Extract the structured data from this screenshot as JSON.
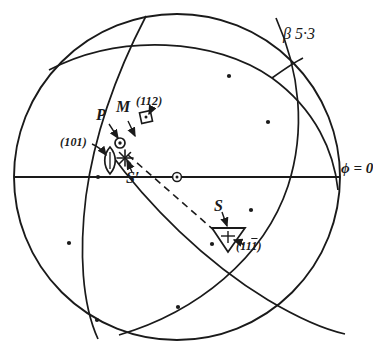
{
  "figure": {
    "type": "stereographic-projection",
    "primitive_circle": {
      "cx": 177,
      "cy": 177,
      "r": 163
    },
    "center_marker": "circled-dot"
  },
  "labels": {
    "beta": "β 5·3",
    "phi": "ϕ = 0",
    "pole_p": "P",
    "pole_m": "M",
    "pole_s_prime": "S′",
    "pole_s": "S",
    "face_101": "(101)",
    "face_112": "(112)",
    "face_11bar1": "(11̅1)"
  },
  "face_indices": {
    "f101": {
      "h": "1",
      "k": "0",
      "l": "1",
      "bar": "none"
    },
    "f112": {
      "h": "1",
      "k": "1",
      "l": "2",
      "bar": "none"
    },
    "f111bar": {
      "h": "1",
      "k": "1",
      "l": "1",
      "bar": "l"
    }
  },
  "markers": [
    {
      "name": "pole-p-circled-dot",
      "symbol": "circled-dot",
      "x": 120,
      "y": 143
    },
    {
      "name": "pole-s-prime-star",
      "symbol": "asterisk",
      "x": 125,
      "y": 158
    },
    {
      "name": "face-101-lens",
      "symbol": "lens",
      "x": 110,
      "y": 160
    },
    {
      "name": "face-112-square",
      "symbol": "square-dot",
      "x": 146,
      "y": 117
    },
    {
      "name": "face-11bar1-triangle",
      "symbol": "triangle-down",
      "x": 228,
      "y": 238
    },
    {
      "name": "center-origin",
      "symbol": "circled-dot",
      "x": 177,
      "y": 177
    }
  ],
  "arc_ticks": [
    {
      "x": 229,
      "y": 76
    },
    {
      "x": 268,
      "y": 122
    },
    {
      "x": 98,
      "y": 177
    },
    {
      "x": 69,
      "y": 243
    },
    {
      "x": 97,
      "y": 320
    },
    {
      "x": 178,
      "y": 307
    },
    {
      "x": 212,
      "y": 244
    },
    {
      "x": 251,
      "y": 210
    }
  ],
  "colors": {
    "ink": "#1a1a1a",
    "paper": "#ffffff"
  }
}
